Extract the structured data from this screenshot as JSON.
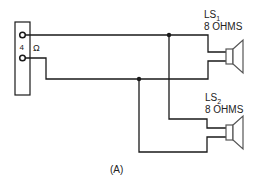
{
  "diagram": {
    "type": "wiring-schematic",
    "caption": "(A)",
    "amplifier_terminal": {
      "impedance_number": "4",
      "impedance_unit": "Ω"
    },
    "speakers": [
      {
        "name": "LS",
        "subscript": "1",
        "impedance": "8 OHMS"
      },
      {
        "name": "LS",
        "subscript": "2",
        "impedance": "8 OHMS"
      }
    ],
    "colors": {
      "line": "#1a1a1a",
      "speaker": "#555555",
      "background": "#ffffff"
    }
  }
}
